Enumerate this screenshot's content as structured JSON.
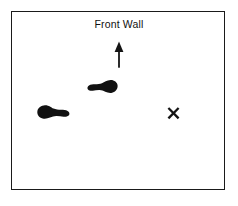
{
  "figure": {
    "title": "Front Wall",
    "background_color": "#ffffff",
    "ink_color": "#1a1a1a"
  },
  "room": {
    "label": "room-boundary",
    "border_color": "#1a1a1a",
    "border_width_px": 1.6,
    "x": 11,
    "y": 11,
    "width": 214,
    "height": 179
  },
  "annotations": {
    "front_wall_label": "Front Wall",
    "arrow": {
      "name": "direction-arrow",
      "direction": "up",
      "x": 112,
      "y": 41,
      "width": 14,
      "height": 27,
      "color": "#1a1a1a"
    },
    "target": {
      "name": "target-x-marker",
      "glyph": "X",
      "x": 166,
      "y": 106,
      "size": 15,
      "color": "#1a1a1a"
    }
  },
  "footprints": [
    {
      "name": "footprint-upper",
      "orientation": "wide-end-right",
      "x": 87,
      "y": 79,
      "width": 31,
      "height": 18,
      "fill": "#111111"
    },
    {
      "name": "footprint-lower",
      "orientation": "wide-end-left",
      "x": 36,
      "y": 104,
      "width": 34,
      "height": 19,
      "fill": "#111111"
    }
  ]
}
